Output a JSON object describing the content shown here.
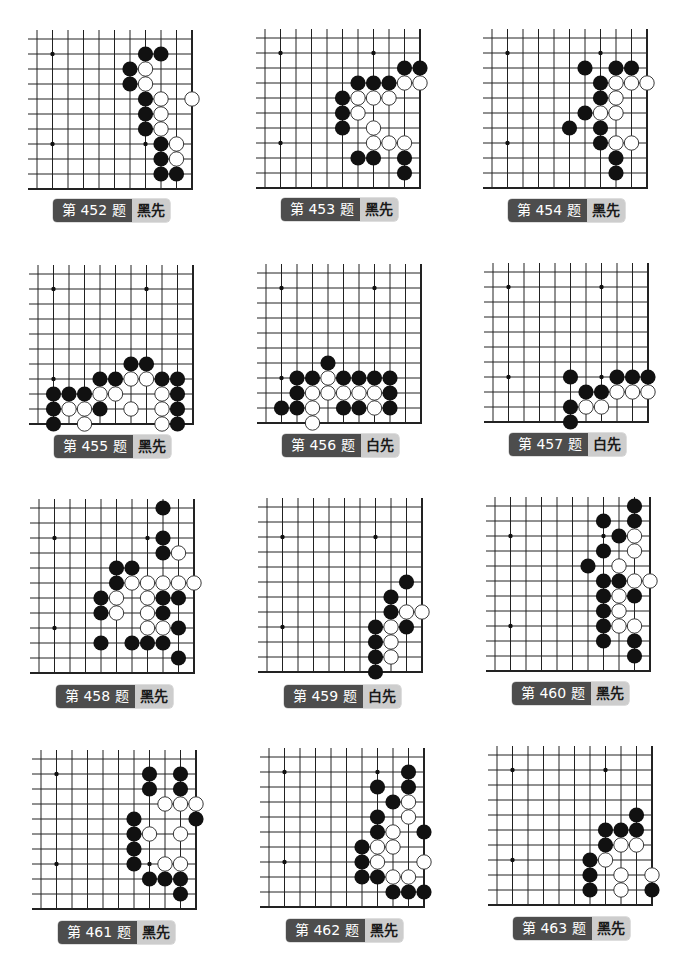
{
  "page": {
    "grid_spacing_x": 15.5,
    "grid_spacing_y": 15,
    "stub": 9,
    "stone_radius": 7.6,
    "colors": {
      "line": "#222222",
      "black_stone": "#111111",
      "white_stone": "#ffffff",
      "star": "#111111",
      "label_dark": "#4d4d4d",
      "label_light": "#cdcdcd"
    }
  },
  "problems": [
    {
      "id": 452,
      "title": "第 452 题",
      "turn": "黑先",
      "board": {
        "x0": 37,
        "y0": 39,
        "cols": 11,
        "rows": 11
      },
      "label": {
        "x": 53,
        "y": 199
      },
      "stars": [
        [
          1,
          1
        ],
        [
          1,
          7
        ],
        [
          7,
          7
        ]
      ],
      "black": [
        [
          7,
          1
        ],
        [
          8,
          1
        ],
        [
          6,
          2
        ],
        [
          6,
          3
        ],
        [
          7,
          4
        ],
        [
          7,
          5
        ],
        [
          7,
          6
        ],
        [
          8,
          7
        ],
        [
          8,
          8
        ],
        [
          8,
          9
        ],
        [
          9,
          9
        ]
      ],
      "white": [
        [
          7,
          2
        ],
        [
          7,
          3
        ],
        [
          8,
          4
        ],
        [
          10,
          4
        ],
        [
          8,
          5
        ],
        [
          8,
          6
        ],
        [
          9,
          7
        ],
        [
          9,
          8
        ]
      ]
    },
    {
      "id": 453,
      "title": "第 453 题",
      "turn": "黑先",
      "board": {
        "x0": 265,
        "y0": 38,
        "cols": 11,
        "rows": 11
      },
      "label": {
        "x": 281,
        "y": 198
      },
      "stars": [
        [
          1,
          1
        ],
        [
          7,
          1
        ],
        [
          1,
          7
        ]
      ],
      "black": [
        [
          9,
          2
        ],
        [
          10,
          2
        ],
        [
          6,
          3
        ],
        [
          7,
          3
        ],
        [
          8,
          3
        ],
        [
          5,
          4
        ],
        [
          5,
          5
        ],
        [
          5,
          6
        ],
        [
          6,
          8
        ],
        [
          7,
          8
        ],
        [
          9,
          8
        ],
        [
          9,
          9
        ]
      ],
      "white": [
        [
          9,
          3
        ],
        [
          10,
          3
        ],
        [
          6,
          4
        ],
        [
          7,
          4
        ],
        [
          8,
          4
        ],
        [
          6,
          5
        ],
        [
          7,
          6
        ],
        [
          7,
          7
        ],
        [
          8,
          7
        ],
        [
          9,
          7
        ]
      ]
    },
    {
      "id": 454,
      "title": "第 454 题",
      "turn": "黑先",
      "board": {
        "x0": 492,
        "y0": 38,
        "cols": 11,
        "rows": 11
      },
      "label": {
        "x": 508,
        "y": 199
      },
      "stars": [
        [
          1,
          1
        ],
        [
          7,
          1
        ],
        [
          1,
          7
        ]
      ],
      "black": [
        [
          6,
          2
        ],
        [
          8,
          2
        ],
        [
          9,
          2
        ],
        [
          7,
          3
        ],
        [
          7,
          4
        ],
        [
          6,
          5
        ],
        [
          5,
          6
        ],
        [
          7,
          6
        ],
        [
          7,
          7
        ],
        [
          8,
          8
        ],
        [
          8,
          9
        ]
      ],
      "white": [
        [
          8,
          3
        ],
        [
          9,
          3
        ],
        [
          10,
          3
        ],
        [
          8,
          4
        ],
        [
          7,
          5
        ],
        [
          8,
          5
        ],
        [
          8,
          7
        ],
        [
          9,
          7
        ]
      ]
    },
    {
      "id": 455,
      "title": "第 455 题",
      "turn": "黑先",
      "board": {
        "x0": 38,
        "y0": 274,
        "cols": 11,
        "rows": 11
      },
      "label": {
        "x": 54,
        "y": 435
      },
      "stars": [
        [
          1,
          1
        ],
        [
          7,
          1
        ],
        [
          1,
          7
        ]
      ],
      "black": [
        [
          6,
          6
        ],
        [
          7,
          6
        ],
        [
          4,
          7
        ],
        [
          5,
          7
        ],
        [
          8,
          7
        ],
        [
          9,
          7
        ],
        [
          1,
          8
        ],
        [
          2,
          8
        ],
        [
          3,
          8
        ],
        [
          9,
          8
        ],
        [
          1,
          9
        ],
        [
          4,
          9
        ],
        [
          9,
          9
        ],
        [
          1,
          10
        ],
        [
          9,
          10
        ]
      ],
      "white": [
        [
          6,
          7
        ],
        [
          7,
          7
        ],
        [
          4,
          8
        ],
        [
          5,
          8
        ],
        [
          8,
          8
        ],
        [
          2,
          9
        ],
        [
          3,
          9
        ],
        [
          6,
          9
        ],
        [
          8,
          9
        ],
        [
          3,
          10
        ],
        [
          8,
          10
        ]
      ]
    },
    {
      "id": 456,
      "title": "第 456 题",
      "turn": "白先",
      "board": {
        "x0": 266,
        "y0": 273,
        "cols": 11,
        "rows": 11
      },
      "label": {
        "x": 282,
        "y": 434
      },
      "stars": [
        [
          1,
          1
        ],
        [
          7,
          1
        ],
        [
          1,
          7
        ]
      ],
      "black": [
        [
          4,
          6
        ],
        [
          2,
          7
        ],
        [
          3,
          7
        ],
        [
          5,
          7
        ],
        [
          6,
          7
        ],
        [
          7,
          7
        ],
        [
          8,
          7
        ],
        [
          2,
          8
        ],
        [
          8,
          8
        ],
        [
          1,
          9
        ],
        [
          2,
          9
        ],
        [
          5,
          9
        ],
        [
          6,
          9
        ],
        [
          8,
          9
        ]
      ],
      "white": [
        [
          4,
          7
        ],
        [
          3,
          8
        ],
        [
          4,
          8
        ],
        [
          5,
          8
        ],
        [
          6,
          8
        ],
        [
          7,
          8
        ],
        [
          3,
          9
        ],
        [
          7,
          9
        ],
        [
          3,
          10
        ]
      ]
    },
    {
      "id": 457,
      "title": "第 457 题",
      "turn": "白先",
      "board": {
        "x0": 493,
        "y0": 272,
        "cols": 11,
        "rows": 11
      },
      "label": {
        "x": 509,
        "y": 433
      },
      "stars": [
        [
          1,
          1
        ],
        [
          7,
          1
        ],
        [
          1,
          7
        ],
        [
          7,
          7
        ]
      ],
      "black": [
        [
          5,
          7
        ],
        [
          8,
          7
        ],
        [
          9,
          7
        ],
        [
          10,
          7
        ],
        [
          6,
          8
        ],
        [
          7,
          8
        ],
        [
          5,
          9
        ],
        [
          5,
          10
        ]
      ],
      "white": [
        [
          8,
          8
        ],
        [
          9,
          8
        ],
        [
          10,
          8
        ],
        [
          6,
          9
        ],
        [
          7,
          9
        ]
      ]
    },
    {
      "id": 458,
      "title": "第 458 题",
      "turn": "黑先",
      "board": {
        "x0": 39,
        "y0": 508,
        "cols": 11,
        "rows": 12
      },
      "label": {
        "x": 56,
        "y": 685
      },
      "stars": [
        [
          1,
          2
        ],
        [
          7,
          2
        ],
        [
          1,
          8
        ]
      ],
      "black": [
        [
          8,
          0
        ],
        [
          8,
          2
        ],
        [
          8,
          3
        ],
        [
          5,
          4
        ],
        [
          6,
          4
        ],
        [
          5,
          5
        ],
        [
          4,
          6
        ],
        [
          8,
          6
        ],
        [
          9,
          6
        ],
        [
          4,
          7
        ],
        [
          8,
          7
        ],
        [
          9,
          8
        ],
        [
          4,
          9
        ],
        [
          6,
          9
        ],
        [
          7,
          9
        ],
        [
          8,
          9
        ],
        [
          9,
          10
        ]
      ],
      "white": [
        [
          9,
          3
        ],
        [
          6,
          5
        ],
        [
          7,
          5
        ],
        [
          8,
          5
        ],
        [
          9,
          5
        ],
        [
          10,
          5
        ],
        [
          5,
          6
        ],
        [
          7,
          6
        ],
        [
          5,
          7
        ],
        [
          7,
          7
        ],
        [
          7,
          8
        ],
        [
          8,
          8
        ]
      ]
    },
    {
      "id": 459,
      "title": "第 459 题",
      "turn": "白先",
      "board": {
        "x0": 267,
        "y0": 507,
        "cols": 11,
        "rows": 12
      },
      "label": {
        "x": 284,
        "y": 685
      },
      "stars": [
        [
          1,
          2
        ],
        [
          7,
          2
        ],
        [
          1,
          8
        ]
      ],
      "black": [
        [
          9,
          5
        ],
        [
          8,
          6
        ],
        [
          8,
          7
        ],
        [
          7,
          8
        ],
        [
          9,
          8
        ],
        [
          7,
          9
        ],
        [
          7,
          10
        ],
        [
          7,
          11
        ]
      ],
      "white": [
        [
          9,
          7
        ],
        [
          10,
          7
        ],
        [
          8,
          8
        ],
        [
          8,
          9
        ],
        [
          8,
          10
        ]
      ]
    },
    {
      "id": 460,
      "title": "第 460 题",
      "turn": "黑先",
      "board": {
        "x0": 495,
        "y0": 506,
        "cols": 11,
        "rows": 12
      },
      "label": {
        "x": 512,
        "y": 682
      },
      "stars": [
        [
          1,
          2
        ],
        [
          7,
          2
        ],
        [
          1,
          8
        ]
      ],
      "black": [
        [
          9,
          0
        ],
        [
          7,
          1
        ],
        [
          9,
          1
        ],
        [
          8,
          2
        ],
        [
          7,
          3
        ],
        [
          6,
          4
        ],
        [
          7,
          5
        ],
        [
          8,
          5
        ],
        [
          7,
          6
        ],
        [
          9,
          6
        ],
        [
          7,
          7
        ],
        [
          7,
          8
        ],
        [
          7,
          9
        ],
        [
          9,
          9
        ],
        [
          9,
          10
        ]
      ],
      "white": [
        [
          9,
          2
        ],
        [
          9,
          3
        ],
        [
          8,
          4
        ],
        [
          9,
          5
        ],
        [
          10,
          5
        ],
        [
          8,
          6
        ],
        [
          8,
          7
        ],
        [
          8,
          8
        ],
        [
          9,
          8
        ]
      ]
    },
    {
      "id": 461,
      "title": "第 461 题",
      "turn": "黑先",
      "board": {
        "x0": 41,
        "y0": 759,
        "cols": 11,
        "rows": 11
      },
      "label": {
        "x": 58,
        "y": 921
      },
      "stars": [
        [
          1,
          1
        ],
        [
          1,
          7
        ],
        [
          7,
          7
        ]
      ],
      "black": [
        [
          7,
          1
        ],
        [
          9,
          1
        ],
        [
          7,
          2
        ],
        [
          9,
          2
        ],
        [
          6,
          4
        ],
        [
          10,
          4
        ],
        [
          6,
          5
        ],
        [
          6,
          6
        ],
        [
          6,
          7
        ],
        [
          7,
          8
        ],
        [
          8,
          8
        ],
        [
          9,
          8
        ],
        [
          9,
          9
        ]
      ],
      "white": [
        [
          8,
          3
        ],
        [
          9,
          3
        ],
        [
          10,
          3
        ],
        [
          7,
          5
        ],
        [
          9,
          5
        ],
        [
          8,
          7
        ],
        [
          9,
          7
        ]
      ]
    },
    {
      "id": 462,
      "title": "第 462 题",
      "turn": "黑先",
      "board": {
        "x0": 269,
        "y0": 757,
        "cols": 11,
        "rows": 11
      },
      "label": {
        "x": 286,
        "y": 919
      },
      "stars": [
        [
          1,
          1
        ],
        [
          7,
          1
        ],
        [
          1,
          7
        ]
      ],
      "black": [
        [
          9,
          1
        ],
        [
          7,
          2
        ],
        [
          9,
          2
        ],
        [
          8,
          3
        ],
        [
          7,
          4
        ],
        [
          7,
          5
        ],
        [
          10,
          5
        ],
        [
          6,
          6
        ],
        [
          6,
          7
        ],
        [
          6,
          8
        ],
        [
          7,
          8
        ],
        [
          8,
          9
        ],
        [
          9,
          9
        ],
        [
          10,
          9
        ]
      ],
      "white": [
        [
          9,
          3
        ],
        [
          9,
          4
        ],
        [
          8,
          5
        ],
        [
          7,
          6
        ],
        [
          8,
          6
        ],
        [
          7,
          7
        ],
        [
          10,
          7
        ],
        [
          8,
          8
        ],
        [
          9,
          8
        ]
      ]
    },
    {
      "id": 463,
      "title": "第 463 题",
      "turn": "黑先",
      "board": {
        "x0": 497,
        "y0": 755,
        "cols": 11,
        "rows": 11
      },
      "label": {
        "x": 513,
        "y": 917
      },
      "stars": [
        [
          1,
          1
        ],
        [
          7,
          1
        ],
        [
          1,
          7
        ]
      ],
      "black": [
        [
          9,
          4
        ],
        [
          7,
          5
        ],
        [
          8,
          5
        ],
        [
          9,
          5
        ],
        [
          7,
          6
        ],
        [
          6,
          7
        ],
        [
          6,
          8
        ],
        [
          6,
          9
        ],
        [
          10,
          9
        ]
      ],
      "white": [
        [
          8,
          6
        ],
        [
          9,
          6
        ],
        [
          7,
          7
        ],
        [
          8,
          8
        ],
        [
          10,
          8
        ],
        [
          8,
          9
        ]
      ]
    }
  ]
}
